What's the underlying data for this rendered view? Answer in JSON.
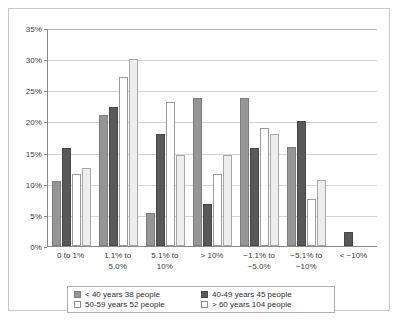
{
  "chart_data": {
    "type": "bar",
    "title": "",
    "subtitle": "",
    "xlabel": "",
    "ylabel": "",
    "ylim": [
      0,
      35
    ],
    "ytick_labels": [
      "0%",
      "5%",
      "10%",
      "15%",
      "20%",
      "25%",
      "30%",
      "35%"
    ],
    "ytick_values": [
      0,
      5,
      10,
      15,
      20,
      25,
      30,
      35
    ],
    "grid": true,
    "legend_position": "bottom",
    "categories": [
      "0 to 1%",
      "1.1% to\n5.0%",
      "5.1% to\n10%",
      "> 10%",
      "−1.1% to\n−5.0%",
      "−5.1% to\n−10%",
      "< −10%"
    ],
    "series": [
      {
        "name": "< 40 years 38 people",
        "color": "#969696",
        "values": [
          10.5,
          21.0,
          5.3,
          23.7,
          23.7,
          15.9,
          0
        ]
      },
      {
        "name": "40-49 years 45 people",
        "color": "#595959",
        "values": [
          15.7,
          22.3,
          18.0,
          6.8,
          15.7,
          20.1,
          2.2
        ]
      },
      {
        "name": "50-59 years 52 people",
        "color": "#ffffff",
        "values": [
          11.5,
          27.1,
          23.1,
          11.5,
          19.0,
          7.6,
          0
        ]
      },
      {
        "name": "> 60 years 104 people",
        "color": "#ededed",
        "values": [
          12.5,
          30.1,
          14.6,
          14.6,
          18.0,
          10.6,
          0
        ]
      }
    ]
  },
  "legend": {
    "items": [
      {
        "label": "< 40 years 38 people"
      },
      {
        "label": "40-49 years 45 people"
      },
      {
        "label": "50-59 years 52 people"
      },
      {
        "label": "> 60 years 104 people"
      }
    ]
  }
}
